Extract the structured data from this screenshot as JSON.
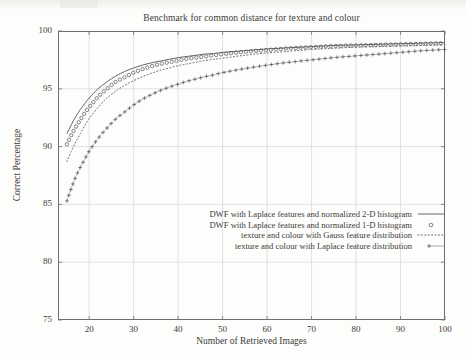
{
  "figure": {
    "title": "Benchmark for common distance for texture and colour",
    "xaxis_label": "Number of Retrieved Images",
    "yaxis_label": "Correct Percentage",
    "xtick_labels": [
      "20",
      "30",
      "40",
      "50",
      "60",
      "70",
      "80",
      "90",
      "100"
    ],
    "ytick_labels": [
      "100",
      "95",
      "90",
      "85",
      "80",
      "75"
    ],
    "ink_color": "#555555",
    "grid_color": "#cfcfcf",
    "frame_color": "#6e6e6e"
  },
  "legend": {
    "position": "inside-lower-right",
    "entries": [
      {
        "label": "DWF with Laplace features and normalized 2-D histogram",
        "key": "solid-line"
      },
      {
        "label": "DWF with Laplace features and normalized 1-D histogram",
        "key": "circle-marker"
      },
      {
        "label": "texture and colour with Gauss feature distribution",
        "key": "dotted-line"
      },
      {
        "label": "texture and colour with Laplace feature distribution",
        "key": "plus-marker"
      }
    ]
  },
  "chart_data": {
    "type": "line",
    "title": "Benchmark for common distance for texture and colour",
    "xlabel": "Number of Retrieved Images",
    "ylabel": "Correct Percentage",
    "xlim": [
      13,
      100
    ],
    "ylim": [
      75,
      100
    ],
    "xticks": [
      20,
      30,
      40,
      50,
      60,
      70,
      80,
      90,
      100
    ],
    "yticks": [
      75,
      80,
      85,
      90,
      95,
      100
    ],
    "grid": true,
    "x": [
      15,
      16,
      17,
      18,
      19,
      20,
      22,
      24,
      26,
      28,
      30,
      32,
      34,
      36,
      38,
      40,
      42,
      44,
      46,
      48,
      50,
      55,
      60,
      65,
      70,
      75,
      80,
      85,
      90,
      95,
      100
    ],
    "series": [
      {
        "name": "DWF with Laplace features and normalized 2-D histogram",
        "style": "solid-line",
        "values": [
          91.1,
          91.9,
          92.6,
          93.2,
          93.7,
          94.2,
          95.0,
          95.6,
          96.1,
          96.5,
          96.8,
          97.05,
          97.25,
          97.4,
          97.55,
          97.7,
          97.8,
          97.9,
          98.0,
          98.05,
          98.15,
          98.3,
          98.45,
          98.55,
          98.65,
          98.75,
          98.8,
          98.85,
          98.9,
          98.95,
          99.0
        ]
      },
      {
        "name": "DWF with Laplace features and normalized 1-D histogram",
        "style": "circle-marker",
        "values": [
          90.2,
          91.0,
          91.7,
          92.3,
          92.9,
          93.4,
          94.3,
          95.0,
          95.6,
          96.0,
          96.4,
          96.7,
          96.95,
          97.15,
          97.3,
          97.45,
          97.6,
          97.7,
          97.8,
          97.9,
          98.0,
          98.2,
          98.35,
          98.5,
          98.6,
          98.7,
          98.75,
          98.8,
          98.85,
          98.9,
          98.95
        ]
      },
      {
        "name": "texture and colour with Gauss feature distribution",
        "style": "dotted-line",
        "values": [
          88.7,
          89.6,
          90.4,
          91.1,
          91.8,
          92.4,
          93.4,
          94.2,
          94.8,
          95.3,
          95.7,
          96.05,
          96.35,
          96.6,
          96.8,
          97.0,
          97.15,
          97.3,
          97.45,
          97.55,
          97.65,
          97.9,
          98.1,
          98.25,
          98.4,
          98.5,
          98.6,
          98.65,
          98.7,
          98.75,
          98.8
        ]
      },
      {
        "name": "texture and colour with Laplace feature distribution",
        "style": "plus-marker",
        "values": [
          85.3,
          86.4,
          87.4,
          88.2,
          88.9,
          89.6,
          90.7,
          91.6,
          92.4,
          93.0,
          93.6,
          94.1,
          94.5,
          94.85,
          95.15,
          95.4,
          95.65,
          95.85,
          96.05,
          96.2,
          96.4,
          96.75,
          97.05,
          97.3,
          97.5,
          97.7,
          97.85,
          98.0,
          98.15,
          98.3,
          98.4
        ]
      }
    ]
  }
}
